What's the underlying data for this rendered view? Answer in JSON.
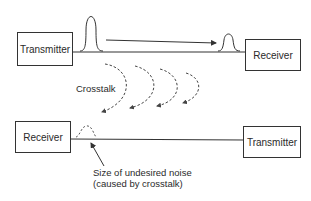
{
  "diagram": {
    "top_line": {
      "left_box": "Transmitter",
      "right_box": "Receiver"
    },
    "bottom_line": {
      "left_box": "Receiver",
      "right_box": "Transmitter"
    },
    "crosstalk_label": "Crosstalk",
    "noise_annotation": {
      "line1": "Size of undesired noise",
      "line2": "(caused by crosstalk)"
    },
    "colors": {
      "line": "#333333",
      "dashed": "#555555"
    }
  }
}
